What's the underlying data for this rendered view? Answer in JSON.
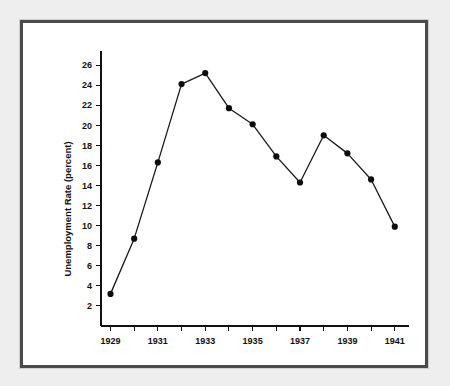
{
  "figure": {
    "frame_color": "#4a4a4a",
    "page_background": "#eeeeee",
    "plot_background": "#ffffff"
  },
  "chart_data": {
    "type": "line",
    "title": "",
    "subtitle": "",
    "xlabel": "",
    "ylabel": "Unemployment Rate (percent)",
    "x": [
      1929,
      1930,
      1931,
      1932,
      1933,
      1934,
      1935,
      1936,
      1937,
      1938,
      1939,
      1940,
      1941
    ],
    "values": [
      3.2,
      8.7,
      16.3,
      24.1,
      25.2,
      21.7,
      20.1,
      16.9,
      14.3,
      19.0,
      17.2,
      14.6,
      9.9
    ],
    "series": [
      {
        "name": "Unemployment Rate",
        "values": [
          3.2,
          8.7,
          16.3,
          24.1,
          25.2,
          21.7,
          20.1,
          16.9,
          14.3,
          19.0,
          17.2,
          14.6,
          9.9
        ],
        "color": "#1a1a1a",
        "marker": "filled-circle"
      }
    ],
    "xlim": [
      1928.6,
      1941.6
    ],
    "ylim": [
      0.0,
      27.4
    ],
    "x_ticks": [
      1929,
      1930,
      1931,
      1932,
      1933,
      1934,
      1935,
      1936,
      1937,
      1938,
      1939,
      1940,
      1941
    ],
    "x_tick_labels": [
      "1929",
      "",
      "1931",
      "",
      "1933",
      "",
      "1935",
      "",
      "1937",
      "",
      "1939",
      "",
      "1941"
    ],
    "y_ticks": [
      2,
      4,
      6,
      8,
      10,
      12,
      14,
      16,
      18,
      20,
      22,
      24,
      26
    ],
    "y_tick_labels": [
      "2",
      "4",
      "6",
      "8",
      "10",
      "12",
      "14",
      "16",
      "18",
      "20",
      "22",
      "24",
      "26"
    ],
    "grid": false,
    "legend": false,
    "legend_position": "none",
    "annotations": []
  }
}
